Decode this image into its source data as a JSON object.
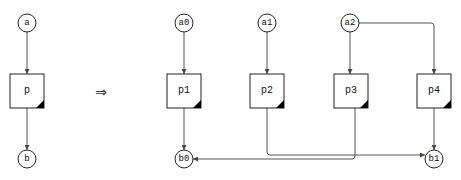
{
  "diagram": {
    "left": {
      "inputs": [
        {
          "id": "a",
          "label": "a"
        }
      ],
      "process": {
        "id": "p",
        "label": "p"
      },
      "outputs": [
        {
          "id": "b",
          "label": "b"
        }
      ]
    },
    "implies_symbol": "⇒",
    "right": {
      "inputs": [
        {
          "id": "a0",
          "label": "a0"
        },
        {
          "id": "a1",
          "label": "a1"
        },
        {
          "id": "a2",
          "label": "a2"
        }
      ],
      "processes": [
        {
          "id": "p1",
          "label": "p1"
        },
        {
          "id": "p2",
          "label": "p2"
        },
        {
          "id": "p3",
          "label": "p3"
        },
        {
          "id": "p4",
          "label": "p4"
        }
      ],
      "outputs": [
        {
          "id": "b0",
          "label": "b0"
        },
        {
          "id": "b1",
          "label": "b1"
        }
      ],
      "edges": [
        {
          "from": "a0",
          "to": "p1"
        },
        {
          "from": "a1",
          "to": "p2"
        },
        {
          "from": "a2",
          "to": "p3"
        },
        {
          "from": "a2",
          "to": "p4"
        },
        {
          "from": "p1",
          "to": "b0"
        },
        {
          "from": "p2",
          "to": "b1"
        },
        {
          "from": "p3",
          "to": "b0"
        },
        {
          "from": "p4",
          "to": "b1"
        }
      ]
    },
    "left_edges": [
      {
        "from": "a",
        "to": "p"
      },
      {
        "from": "p",
        "to": "b"
      }
    ],
    "colors": {
      "edge": "#555555",
      "node_stroke": "#222222",
      "corner_mark": "#000000",
      "background": "#ffffff"
    }
  }
}
